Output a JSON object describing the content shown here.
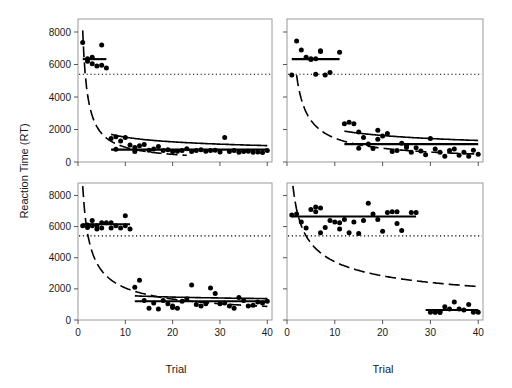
{
  "figure": {
    "ylabel": "Reaction Time (RT)",
    "xlabel_left": "Trial",
    "xlabel_right": "Trial",
    "yticks": [
      0,
      2000,
      4000,
      6000,
      8000
    ],
    "ytick_labels": [
      "0",
      "2000",
      "4000",
      "6000",
      "8000"
    ],
    "xticks": [
      0,
      10,
      20,
      30,
      40
    ],
    "xtick_labels": [
      "0",
      "10",
      "20",
      "30",
      "40"
    ],
    "colors": {
      "point": "#000000",
      "curve": "#000000",
      "frame": "#9a9a9a",
      "text": "#1a1a1a"
    }
  },
  "chart_data": {
    "type": "scatter",
    "title": "",
    "xlabel": "Trial",
    "ylabel": "Reaction Time (RT)",
    "xlim": [
      0,
      41
    ],
    "ylim": [
      0,
      8800
    ],
    "grid": false,
    "legend": "none",
    "panel_layout": "2x2",
    "shared_annotation": {
      "threshold_line": {
        "label": "criterion RT",
        "value": 5400,
        "style": "dotted",
        "spans_all_panels": true
      }
    },
    "panels": [
      {
        "id": "top-left",
        "row": 0,
        "col": 0,
        "points": [
          {
            "x": 1,
            "y": 7350
          },
          {
            "x": 2,
            "y": 6200
          },
          {
            "x": 2,
            "y": 6350
          },
          {
            "x": 3,
            "y": 6050
          },
          {
            "x": 3,
            "y": 6450
          },
          {
            "x": 4,
            "y": 5900
          },
          {
            "x": 5,
            "y": 5950
          },
          {
            "x": 5,
            "y": 7200
          },
          {
            "x": 6,
            "y": 5780
          },
          {
            "x": 7,
            "y": 1450
          },
          {
            "x": 8,
            "y": 1550
          },
          {
            "x": 8,
            "y": 780
          },
          {
            "x": 9,
            "y": 1300
          },
          {
            "x": 10,
            "y": 1500
          },
          {
            "x": 11,
            "y": 1050
          },
          {
            "x": 12,
            "y": 900
          },
          {
            "x": 12,
            "y": 650
          },
          {
            "x": 13,
            "y": 1000
          },
          {
            "x": 14,
            "y": 1080
          },
          {
            "x": 15,
            "y": 720
          },
          {
            "x": 16,
            "y": 800
          },
          {
            "x": 17,
            "y": 950
          },
          {
            "x": 18,
            "y": 700
          },
          {
            "x": 19,
            "y": 760
          },
          {
            "x": 20,
            "y": 640
          },
          {
            "x": 21,
            "y": 660
          },
          {
            "x": 22,
            "y": 700
          },
          {
            "x": 23,
            "y": 820
          },
          {
            "x": 24,
            "y": 640
          },
          {
            "x": 25,
            "y": 700
          },
          {
            "x": 26,
            "y": 760
          },
          {
            "x": 27,
            "y": 660
          },
          {
            "x": 28,
            "y": 700
          },
          {
            "x": 29,
            "y": 720
          },
          {
            "x": 30,
            "y": 620
          },
          {
            "x": 31,
            "y": 1500
          },
          {
            "x": 32,
            "y": 640
          },
          {
            "x": 33,
            "y": 700
          },
          {
            "x": 34,
            "y": 600
          },
          {
            "x": 35,
            "y": 640
          },
          {
            "x": 36,
            "y": 660
          },
          {
            "x": 37,
            "y": 600
          },
          {
            "x": 38,
            "y": 620
          },
          {
            "x": 39,
            "y": 580
          },
          {
            "x": 40,
            "y": 700
          }
        ],
        "plateau_segments": [
          {
            "x_start": 1,
            "x_end": 6,
            "y": 6330
          },
          {
            "x_start": 7,
            "x_end": 40,
            "y": 760
          }
        ],
        "power_curve": {
          "style": "dashed",
          "a": 8100,
          "b": 0.95,
          "x_start": 1,
          "x_end": 23
        },
        "fit_curve": {
          "style": "solid",
          "a": 1700,
          "b": 0.3,
          "x_start": 7,
          "x_end": 40
        }
      },
      {
        "id": "top-right",
        "row": 0,
        "col": 1,
        "points": [
          {
            "x": 1,
            "y": 5350
          },
          {
            "x": 2,
            "y": 7450
          },
          {
            "x": 3,
            "y": 6900
          },
          {
            "x": 4,
            "y": 6450
          },
          {
            "x": 5,
            "y": 6300
          },
          {
            "x": 5,
            "y": 6350
          },
          {
            "x": 6,
            "y": 6350
          },
          {
            "x": 6,
            "y": 5400
          },
          {
            "x": 7,
            "y": 6800
          },
          {
            "x": 7,
            "y": 6850
          },
          {
            "x": 8,
            "y": 5350
          },
          {
            "x": 9,
            "y": 5500
          },
          {
            "x": 11,
            "y": 6750
          },
          {
            "x": 12,
            "y": 2350
          },
          {
            "x": 13,
            "y": 2450
          },
          {
            "x": 14,
            "y": 2350
          },
          {
            "x": 15,
            "y": 1850
          },
          {
            "x": 15,
            "y": 850
          },
          {
            "x": 16,
            "y": 1500
          },
          {
            "x": 17,
            "y": 1100
          },
          {
            "x": 18,
            "y": 830
          },
          {
            "x": 19,
            "y": 1950
          },
          {
            "x": 19,
            "y": 1400
          },
          {
            "x": 20,
            "y": 1600
          },
          {
            "x": 21,
            "y": 1750
          },
          {
            "x": 22,
            "y": 640
          },
          {
            "x": 23,
            "y": 700
          },
          {
            "x": 24,
            "y": 1150
          },
          {
            "x": 25,
            "y": 900
          },
          {
            "x": 25,
            "y": 1000
          },
          {
            "x": 26,
            "y": 600
          },
          {
            "x": 27,
            "y": 880
          },
          {
            "x": 28,
            "y": 680
          },
          {
            "x": 29,
            "y": 450
          },
          {
            "x": 30,
            "y": 1450
          },
          {
            "x": 31,
            "y": 800
          },
          {
            "x": 32,
            "y": 600
          },
          {
            "x": 33,
            "y": 350
          },
          {
            "x": 34,
            "y": 700
          },
          {
            "x": 35,
            "y": 800
          },
          {
            "x": 36,
            "y": 420
          },
          {
            "x": 37,
            "y": 600
          },
          {
            "x": 38,
            "y": 350
          },
          {
            "x": 39,
            "y": 720
          },
          {
            "x": 40,
            "y": 480
          }
        ],
        "plateau_segments": [
          {
            "x_start": 1,
            "x_end": 11,
            "y": 6330
          },
          {
            "x_start": 12,
            "x_end": 40,
            "y": 1100
          }
        ],
        "power_curve": {
          "style": "dashed",
          "a": 9300,
          "b": 0.8,
          "x_start": 2,
          "x_end": 40
        },
        "fit_curve": {
          "style": "solid",
          "a": 1900,
          "b": 0.3,
          "x_start": 12,
          "x_end": 40
        }
      },
      {
        "id": "bottom-left",
        "row": 1,
        "col": 0,
        "points": [
          {
            "x": 1,
            "y": 6050
          },
          {
            "x": 2,
            "y": 6100
          },
          {
            "x": 2,
            "y": 5950
          },
          {
            "x": 3,
            "y": 6400
          },
          {
            "x": 3,
            "y": 6050
          },
          {
            "x": 4,
            "y": 6050
          },
          {
            "x": 4,
            "y": 5850
          },
          {
            "x": 5,
            "y": 6250
          },
          {
            "x": 5,
            "y": 5900
          },
          {
            "x": 6,
            "y": 6250
          },
          {
            "x": 7,
            "y": 6250
          },
          {
            "x": 7,
            "y": 5900
          },
          {
            "x": 8,
            "y": 6050
          },
          {
            "x": 9,
            "y": 5900
          },
          {
            "x": 10,
            "y": 6700
          },
          {
            "x": 10,
            "y": 6050
          },
          {
            "x": 11,
            "y": 5850
          },
          {
            "x": 12,
            "y": 2100
          },
          {
            "x": 13,
            "y": 2550
          },
          {
            "x": 14,
            "y": 1250
          },
          {
            "x": 15,
            "y": 750
          },
          {
            "x": 16,
            "y": 1100
          },
          {
            "x": 17,
            "y": 700
          },
          {
            "x": 18,
            "y": 1250
          },
          {
            "x": 19,
            "y": 1050
          },
          {
            "x": 20,
            "y": 800
          },
          {
            "x": 20,
            "y": 900
          },
          {
            "x": 21,
            "y": 750
          },
          {
            "x": 22,
            "y": 1200
          },
          {
            "x": 23,
            "y": 1350
          },
          {
            "x": 24,
            "y": 2250
          },
          {
            "x": 25,
            "y": 1000
          },
          {
            "x": 26,
            "y": 900
          },
          {
            "x": 27,
            "y": 1050
          },
          {
            "x": 28,
            "y": 2050
          },
          {
            "x": 29,
            "y": 1700
          },
          {
            "x": 30,
            "y": 1050
          },
          {
            "x": 31,
            "y": 1100
          },
          {
            "x": 32,
            "y": 900
          },
          {
            "x": 33,
            "y": 750
          },
          {
            "x": 34,
            "y": 1450
          },
          {
            "x": 35,
            "y": 1250
          },
          {
            "x": 36,
            "y": 900
          },
          {
            "x": 37,
            "y": 950
          },
          {
            "x": 38,
            "y": 1150
          },
          {
            "x": 39,
            "y": 1100
          },
          {
            "x": 40,
            "y": 1200
          }
        ],
        "plateau_segments": [
          {
            "x_start": 1,
            "x_end": 11,
            "y": 6150
          },
          {
            "x_start": 12,
            "x_end": 40,
            "y": 1200
          }
        ],
        "power_curve": {
          "style": "dashed",
          "a": 8600,
          "b": 0.62,
          "x_start": 1,
          "x_end": 40
        },
        "fit_curve": {
          "style": "solid",
          "a": 1550,
          "b": 0.1,
          "x_start": 12,
          "x_end": 40
        }
      },
      {
        "id": "bottom-right",
        "row": 1,
        "col": 1,
        "points": [
          {
            "x": 1,
            "y": 6750
          },
          {
            "x": 2,
            "y": 6800
          },
          {
            "x": 3,
            "y": 6300
          },
          {
            "x": 4,
            "y": 5900
          },
          {
            "x": 5,
            "y": 7100
          },
          {
            "x": 6,
            "y": 7250
          },
          {
            "x": 6,
            "y": 6950
          },
          {
            "x": 7,
            "y": 7200
          },
          {
            "x": 7,
            "y": 5600
          },
          {
            "x": 8,
            "y": 5950
          },
          {
            "x": 9,
            "y": 6400
          },
          {
            "x": 10,
            "y": 6300
          },
          {
            "x": 11,
            "y": 6250
          },
          {
            "x": 11,
            "y": 5850
          },
          {
            "x": 12,
            "y": 6450
          },
          {
            "x": 13,
            "y": 5600
          },
          {
            "x": 14,
            "y": 6300
          },
          {
            "x": 15,
            "y": 5550
          },
          {
            "x": 16,
            "y": 6400
          },
          {
            "x": 17,
            "y": 7500
          },
          {
            "x": 18,
            "y": 6800
          },
          {
            "x": 19,
            "y": 6450
          },
          {
            "x": 20,
            "y": 5700
          },
          {
            "x": 21,
            "y": 6900
          },
          {
            "x": 22,
            "y": 6950
          },
          {
            "x": 23,
            "y": 6950
          },
          {
            "x": 23,
            "y": 6200
          },
          {
            "x": 24,
            "y": 5750
          },
          {
            "x": 26,
            "y": 6900
          },
          {
            "x": 27,
            "y": 6900
          },
          {
            "x": 30,
            "y": 500
          },
          {
            "x": 31,
            "y": 500
          },
          {
            "x": 31,
            "y": 520
          },
          {
            "x": 32,
            "y": 550
          },
          {
            "x": 32,
            "y": 480
          },
          {
            "x": 33,
            "y": 850
          },
          {
            "x": 34,
            "y": 700
          },
          {
            "x": 35,
            "y": 1150
          },
          {
            "x": 36,
            "y": 700
          },
          {
            "x": 37,
            "y": 650
          },
          {
            "x": 38,
            "y": 1000
          },
          {
            "x": 39,
            "y": 500
          },
          {
            "x": 40,
            "y": 500
          }
        ],
        "plateau_segments": [
          {
            "x_start": 1,
            "x_end": 27,
            "y": 6650
          },
          {
            "x_start": 29,
            "x_end": 40,
            "y": 640
          }
        ],
        "power_curve": {
          "style": "dashed",
          "a": 9400,
          "b": 0.4,
          "x_start": 1,
          "x_end": 40
        },
        "fit_curve": null
      }
    ]
  }
}
